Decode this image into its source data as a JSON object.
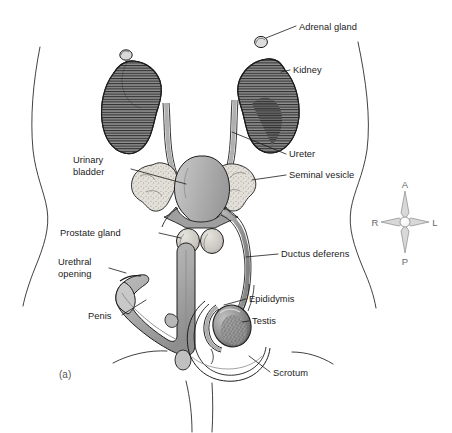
{
  "figure": {
    "panel_label": "(a)",
    "caption_visible": false,
    "background_color": "#ffffff",
    "ink_color": "#1a1a1a"
  },
  "labels": {
    "adrenal_gland": "Adrenal gland",
    "kidney": "Kidney",
    "ureter": "Ureter",
    "seminal_vesicle": "Seminal vesicle",
    "ductus_deferens": "Ductus deferens",
    "epididymis": "Epididymis",
    "testis": "Testis",
    "scrotum": "Scrotum",
    "urinary_bladder_line1": "Urinary",
    "urinary_bladder_line2": "bladder",
    "prostate_gland": "Prostate gland",
    "urethral_opening_line1": "Urethral",
    "urethral_opening_line2": "opening",
    "penis": "Penis"
  },
  "compass": {
    "anterior": "A",
    "posterior": "P",
    "right": "R",
    "left": "L",
    "color": "#6a6a6a"
  },
  "palette": {
    "kidney_fill": "#8a8a8a",
    "kidney_dark": "#3c3c3c",
    "bladder_fill": "#b3b3b3",
    "vesicle_fill": "#dedcd4",
    "prostate_fill": "#cfcdc6",
    "duct_fill": "#a8a8a8",
    "penis_fill": "#b0b0b0",
    "testis_fill": "#9a9a9a",
    "outline": "#1d1d1d"
  },
  "structures": [
    {
      "name": "adrenal-gland",
      "side": "both",
      "label_key": "adrenal_gland"
    },
    {
      "name": "kidney",
      "side": "both",
      "label_key": "kidney"
    },
    {
      "name": "ureter",
      "side": "both",
      "label_key": "ureter"
    },
    {
      "name": "urinary-bladder",
      "side": "midline",
      "label_key": "urinary_bladder_line1"
    },
    {
      "name": "seminal-vesicle",
      "side": "both",
      "label_key": "seminal_vesicle"
    },
    {
      "name": "prostate-gland",
      "side": "midline",
      "label_key": "prostate_gland"
    },
    {
      "name": "ductus-deferens",
      "side": "both",
      "label_key": "ductus_deferens"
    },
    {
      "name": "epididymis",
      "side": "both",
      "label_key": "epididymis"
    },
    {
      "name": "testis",
      "side": "both",
      "label_key": "testis"
    },
    {
      "name": "scrotum",
      "side": "midline",
      "label_key": "scrotum"
    },
    {
      "name": "penis",
      "side": "midline",
      "label_key": "penis"
    },
    {
      "name": "urethral-opening",
      "side": "midline",
      "label_key": "urethral_opening_line1"
    }
  ]
}
